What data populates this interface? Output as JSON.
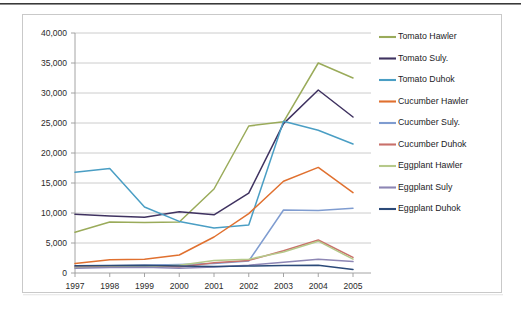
{
  "chart_data": {
    "type": "line",
    "title": "",
    "subtitle": "",
    "xlabel": "",
    "ylabel": "",
    "categories": [
      "1997",
      "1998",
      "1999",
      "2000",
      "2001",
      "2002",
      "2003",
      "2004",
      "2005"
    ],
    "x": [
      1997,
      1998,
      1999,
      2000,
      2001,
      2002,
      2003,
      2004,
      2005
    ],
    "ylim": [
      0,
      40000
    ],
    "ytick_values": [
      0,
      5000,
      10000,
      15000,
      20000,
      25000,
      30000,
      35000,
      40000
    ],
    "ytick_labels": [
      "0",
      "5,000",
      "10,000",
      "15,000",
      "20,000",
      "25,000",
      "30,000",
      "35,000",
      "40,000"
    ],
    "grid": true,
    "legend_position": "right",
    "series": [
      {
        "name": "Tomato Hawler",
        "color": "#9aab5a",
        "values": [
          6800,
          8500,
          8400,
          8500,
          14000,
          24500,
          25200,
          35000,
          32500
        ]
      },
      {
        "name": "Tomato Suly.",
        "color": "#3f3260",
        "values": [
          9800,
          9500,
          9300,
          10200,
          9700,
          13300,
          24900,
          30500,
          26000
        ]
      },
      {
        "name": "Tomato Duhok",
        "color": "#4a9ec4",
        "values": [
          16800,
          17400,
          11000,
          8600,
          7500,
          8000,
          25300,
          23800,
          21500
        ]
      },
      {
        "name": "Cucumber Hawler",
        "color": "#e0702f",
        "values": [
          1600,
          2200,
          2300,
          3000,
          6000,
          9900,
          15300,
          17600,
          13400
        ]
      },
      {
        "name": "Cucumber Suly.",
        "color": "#7f9cd0",
        "values": [
          1100,
          1200,
          1300,
          1400,
          1600,
          2000,
          10500,
          10400,
          10800
        ]
      },
      {
        "name": "Cucumber Duhok",
        "color": "#c9706a",
        "values": [
          1000,
          1100,
          1200,
          1000,
          1700,
          2100,
          3700,
          5500,
          2600
        ]
      },
      {
        "name": "Eggplant Hawler",
        "color": "#b6c98a",
        "values": [
          900,
          1000,
          1100,
          1300,
          2100,
          2300,
          3500,
          5300,
          2300
        ]
      },
      {
        "name": "Eggplant Suly",
        "color": "#8d86b4",
        "values": [
          800,
          900,
          950,
          800,
          1000,
          1300,
          1800,
          2300,
          1900
        ]
      },
      {
        "name": "Eggplant Duhok",
        "color": "#2b4a78",
        "values": [
          1200,
          1250,
          1300,
          1150,
          1100,
          1150,
          1250,
          1300,
          600
        ]
      }
    ]
  }
}
